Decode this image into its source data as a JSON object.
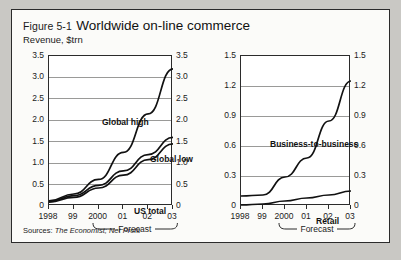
{
  "figure": {
    "number": "Figure 5-1",
    "title": "Worldwide on-line commerce",
    "subtitle": "Revenue, $trn",
    "sources_lead": "Sources:",
    "sources_text": "The Economist; Net Profit",
    "forecast_label": "Forecast",
    "border_color": "#2b2b2b",
    "page_background": "#c9c8c4",
    "panel_background": "#fbfbf9",
    "line_color": "#111111",
    "grid_color": "#9a9a98"
  },
  "chart_data": [
    {
      "type": "line",
      "title": "Worldwide on-line commerce",
      "xlabel": "",
      "ylabel": "Revenue, $trn",
      "categories": [
        "1998",
        "99",
        "2000",
        "01",
        "02",
        "03"
      ],
      "x_tick_labels": [
        "1998",
        "99",
        "2000",
        "01",
        "02",
        "03"
      ],
      "ylim": [
        0,
        3.5
      ],
      "y_ticks": [
        0,
        0.5,
        1.0,
        1.5,
        2.0,
        2.5,
        3.0,
        3.5
      ],
      "y_tick_labels": [
        "0",
        "0.5",
        "1.0",
        "1.5",
        "2.0",
        "2.5",
        "3.0",
        "3.5"
      ],
      "y_axis_mirrored": true,
      "grid": true,
      "legend_position": "inline-labels",
      "forecast_from": "2000",
      "forecast_to": "03",
      "annotations": [
        "Global high",
        "Global low",
        "US total"
      ],
      "series": [
        {
          "name": "Global high",
          "values": [
            0.12,
            0.28,
            0.62,
            1.25,
            2.15,
            3.2
          ]
        },
        {
          "name": "Global low",
          "values": [
            0.1,
            0.24,
            0.48,
            0.82,
            1.2,
            1.6
          ]
        },
        {
          "name": "US total",
          "values": [
            0.09,
            0.2,
            0.42,
            0.72,
            1.08,
            1.45
          ]
        }
      ]
    },
    {
      "type": "line",
      "title": "",
      "xlabel": "",
      "ylabel": "",
      "categories": [
        "1998",
        "99",
        "2000",
        "01",
        "02",
        "03"
      ],
      "x_tick_labels": [
        "1998",
        "99",
        "2000",
        "01",
        "02",
        "03"
      ],
      "ylim": [
        0,
        1.5
      ],
      "y_ticks": [
        0,
        0.3,
        0.6,
        0.9,
        1.2,
        1.5
      ],
      "y_tick_labels": [
        "0",
        "0.3",
        "0.6",
        "0.9",
        "1.2",
        "1.5"
      ],
      "y_axis_mirrored": true,
      "grid": true,
      "legend_position": "inline-labels",
      "forecast_from": "2000",
      "forecast_to": "03",
      "annotations": [
        "Business-to-business",
        "Retail"
      ],
      "series": [
        {
          "name": "Business-to-business",
          "values": [
            0.1,
            0.11,
            0.29,
            0.48,
            0.85,
            1.25
          ]
        },
        {
          "name": "Retail",
          "values": [
            0.01,
            0.02,
            0.05,
            0.08,
            0.11,
            0.15
          ]
        }
      ]
    }
  ]
}
